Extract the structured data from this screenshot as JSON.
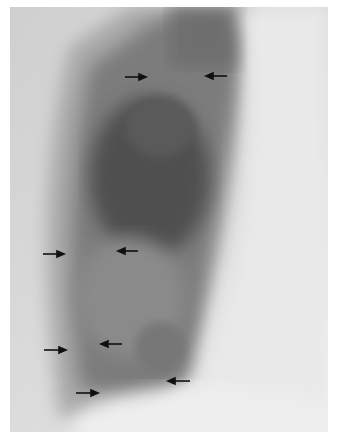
{
  "image": {
    "description": "Lateral chest radiograph with black arrows marking lung opacity margins",
    "colors": {
      "background": "#ffffff",
      "film_light": "#e2e2e2",
      "film_mid": "#9a9a9a",
      "film_dark": "#555555",
      "arrow": "#111111"
    }
  },
  "arrows": [
    {
      "direction": "right",
      "x": 125,
      "y": 77
    },
    {
      "direction": "left",
      "x": 206,
      "y": 76
    },
    {
      "direction": "right",
      "x": 43,
      "y": 254
    },
    {
      "direction": "left",
      "x": 118,
      "y": 251
    },
    {
      "direction": "right",
      "x": 44,
      "y": 350
    },
    {
      "direction": "left",
      "x": 101,
      "y": 344
    },
    {
      "direction": "right",
      "x": 76,
      "y": 393
    },
    {
      "direction": "left",
      "x": 168,
      "y": 381
    }
  ]
}
